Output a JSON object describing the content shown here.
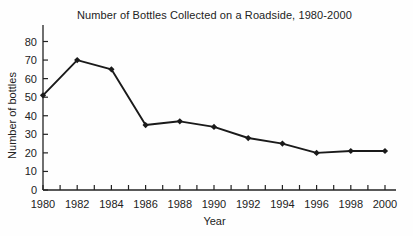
{
  "chart_data": {
    "type": "line",
    "title": "Number of Bottles Collected on a Roadside, 1980-2000",
    "xlabel": "Year",
    "ylabel": "Number of bottles",
    "x": [
      1980,
      1982,
      1984,
      1986,
      1988,
      1990,
      1992,
      1994,
      1996,
      1998,
      2000
    ],
    "values": [
      51,
      70,
      65,
      35,
      37,
      34,
      28,
      25,
      20,
      21,
      21
    ],
    "xlim": [
      1980,
      2000
    ],
    "ylim": [
      0,
      80
    ],
    "ytick_step": 10,
    "xtick_minor_step": 1,
    "xtick_label_step": 2,
    "grid": false,
    "legend_position": "none",
    "marker": "diamond",
    "line_color": "#1a1a1a",
    "axis_color": "#222222",
    "text_color": "#222222"
  }
}
